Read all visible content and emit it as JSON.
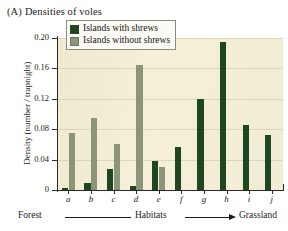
{
  "figure": {
    "panel_letter": "(A)",
    "panel_title": "Densities of voles"
  },
  "legend": {
    "entries": [
      {
        "label": "Islands with shrews",
        "color": "#1e4620",
        "swatch": "dark-green-swatch"
      },
      {
        "label": "Islands without shrews",
        "color": "#8c9479",
        "swatch": "gray-green-swatch"
      }
    ]
  },
  "axes": {
    "y_title": "Density (number / trapnight)",
    "y_ticks": [
      "0",
      "0.04",
      "0.08",
      "0.12",
      "0.16",
      "0.20"
    ],
    "x_categories": [
      "a",
      "b",
      "c",
      "d",
      "e",
      "f",
      "g",
      "h",
      "i",
      "j"
    ],
    "habitat_caption": {
      "left": "Forest",
      "middle": "Habitats",
      "right": "Grassland"
    }
  },
  "chart_data": {
    "type": "bar",
    "xlabel": "Habitats",
    "ylabel": "Density (number / trapnight)",
    "categories": [
      "a",
      "b",
      "c",
      "d",
      "e",
      "f",
      "g",
      "h",
      "i",
      "j"
    ],
    "ylim": [
      0,
      0.2
    ],
    "yticks": [
      0,
      0.04,
      0.08,
      0.12,
      0.16,
      0.2
    ],
    "grid": true,
    "legend_position": "top-left-inside",
    "series": [
      {
        "name": "Islands with shrews",
        "color": "#1e4620",
        "values": [
          0.003,
          0.009,
          0.027,
          0.005,
          0.038,
          0.057,
          0.12,
          0.195,
          0.085,
          0.073
        ]
      },
      {
        "name": "Islands without shrews",
        "color": "#8c9479",
        "values": [
          0.075,
          0.095,
          0.06,
          0.165,
          0.03,
          0,
          0,
          0,
          0,
          0
        ]
      }
    ],
    "annotations": [
      "Forest",
      "Habitats",
      "Grassland"
    ]
  }
}
